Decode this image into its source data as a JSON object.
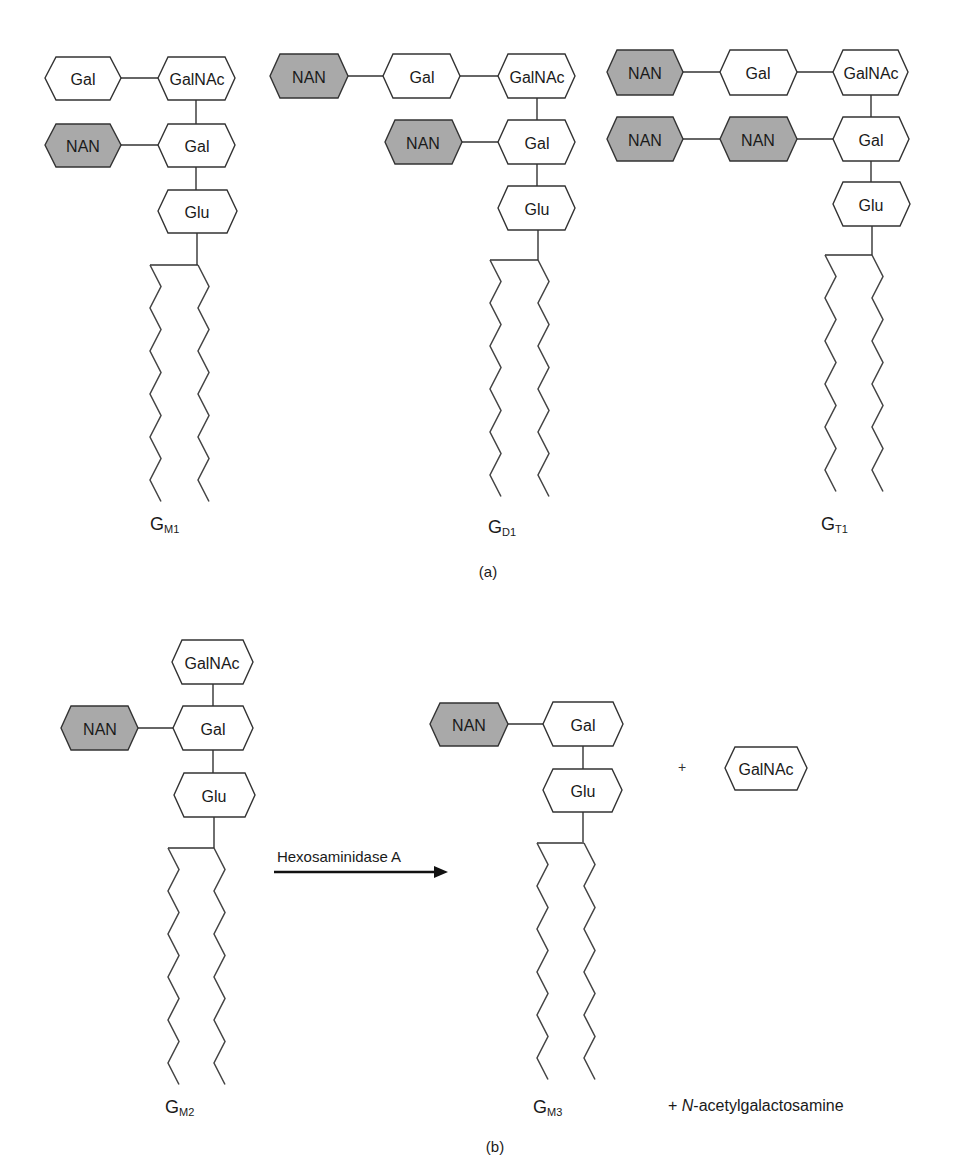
{
  "figure": {
    "panels": [
      {
        "label": "(a)",
        "molecules": [
          {
            "id": "GM1",
            "name": "G",
            "subscript": "M1",
            "residues": [
              {
                "key": "gal_top",
                "label": "Gal",
                "type": "sugar"
              },
              {
                "key": "galnac",
                "label": "GalNAc",
                "type": "sugar"
              },
              {
                "key": "nan",
                "label": "NAN",
                "type": "sialic"
              },
              {
                "key": "gal",
                "label": "Gal",
                "type": "sugar"
              },
              {
                "key": "glu",
                "label": "Glu",
                "type": "sugar"
              }
            ]
          },
          {
            "id": "GD1",
            "name": "G",
            "subscript": "D1",
            "residues": [
              {
                "key": "nan_top",
                "label": "NAN",
                "type": "sialic"
              },
              {
                "key": "gal_top",
                "label": "Gal",
                "type": "sugar"
              },
              {
                "key": "galnac",
                "label": "GalNAc",
                "type": "sugar"
              },
              {
                "key": "nan",
                "label": "NAN",
                "type": "sialic"
              },
              {
                "key": "gal",
                "label": "Gal",
                "type": "sugar"
              },
              {
                "key": "glu",
                "label": "Glu",
                "type": "sugar"
              }
            ]
          },
          {
            "id": "GT1",
            "name": "G",
            "subscript": "T1",
            "residues": [
              {
                "key": "nan_top",
                "label": "NAN",
                "type": "sialic"
              },
              {
                "key": "gal_top",
                "label": "Gal",
                "type": "sugar"
              },
              {
                "key": "galnac",
                "label": "GalNAc",
                "type": "sugar"
              },
              {
                "key": "nan_outer",
                "label": "NAN",
                "type": "sialic"
              },
              {
                "key": "nan_inner",
                "label": "NAN",
                "type": "sialic"
              },
              {
                "key": "gal",
                "label": "Gal",
                "type": "sugar"
              },
              {
                "key": "glu",
                "label": "Glu",
                "type": "sugar"
              }
            ]
          }
        ]
      },
      {
        "label": "(b)",
        "molecules": [
          {
            "id": "GM2",
            "name": "G",
            "subscript": "M2",
            "residues": [
              {
                "key": "galnac",
                "label": "GalNAc",
                "type": "sugar"
              },
              {
                "key": "nan",
                "label": "NAN",
                "type": "sialic"
              },
              {
                "key": "gal",
                "label": "Gal",
                "type": "sugar"
              },
              {
                "key": "glu",
                "label": "Glu",
                "type": "sugar"
              }
            ]
          },
          {
            "id": "GM3",
            "name": "G",
            "subscript": "M3",
            "residues": [
              {
                "key": "nan",
                "label": "NAN",
                "type": "sialic"
              },
              {
                "key": "gal",
                "label": "Gal",
                "type": "sugar"
              },
              {
                "key": "glu",
                "label": "Glu",
                "type": "sugar"
              }
            ]
          }
        ],
        "reaction": {
          "enzyme": "Hexosaminidase A",
          "plus_symbol": "+",
          "released_residue": "GalNAc",
          "byproduct_prefix": "+ ",
          "byproduct_italic": "N",
          "byproduct_rest": "-acetylgalactosamine"
        }
      }
    ],
    "colors": {
      "sugar_fill": "#ffffff",
      "sialic_fill": "#a9a9a9",
      "outline": "#333333"
    }
  }
}
